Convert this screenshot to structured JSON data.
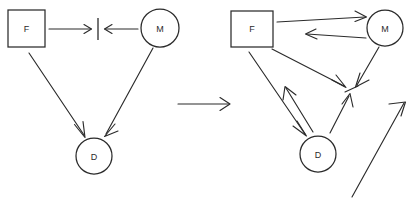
{
  "figure": {
    "background_color": "#ffffff",
    "stroke_color": "#2b2b2b",
    "width": 411,
    "height": 204,
    "style": "hand-drawn line diagram, open v-shaped arrowheads"
  },
  "panels": [
    {
      "id": "left-panel",
      "name": "before-state-diagram",
      "nodes": [
        {
          "id": "F",
          "label": "F",
          "shape": "square",
          "x": 26,
          "y": 28
        },
        {
          "id": "M",
          "label": "M",
          "shape": "circle",
          "x": 160,
          "y": 28
        },
        {
          "id": "D",
          "label": "D",
          "shape": "circle",
          "x": 94,
          "y": 156
        },
        {
          "id": "BAR",
          "label": "",
          "shape": "vertical-bar",
          "x": 98,
          "y": 29
        }
      ],
      "edges": [
        {
          "from": "F",
          "to": "BAR",
          "direction": "forward"
        },
        {
          "from": "M",
          "to": "BAR",
          "direction": "forward"
        },
        {
          "from": "F",
          "to": "D",
          "direction": "forward"
        },
        {
          "from": "M",
          "to": "D",
          "direction": "forward"
        }
      ]
    },
    {
      "id": "transition",
      "name": "transition-arrow",
      "edges": [
        {
          "from": "left-panel",
          "to": "right-panel",
          "direction": "forward"
        }
      ]
    },
    {
      "id": "right-panel",
      "name": "after-state-diagram",
      "nodes": [
        {
          "id": "F2",
          "label": "F",
          "shape": "square",
          "x": 257,
          "y": 28
        },
        {
          "id": "M2",
          "label": "M",
          "shape": "circle",
          "x": 385,
          "y": 28
        },
        {
          "id": "D2",
          "label": "D",
          "shape": "circle",
          "x": 318,
          "y": 154
        },
        {
          "id": "HUB",
          "label": "",
          "shape": "hub-point",
          "x": 350,
          "y": 88
        }
      ],
      "edges": [
        {
          "from": "F2",
          "to": "M2",
          "direction": "forward"
        },
        {
          "from": "M2",
          "to": "F2",
          "direction": "forward"
        },
        {
          "from": "F2",
          "to": "HUB",
          "direction": "forward"
        },
        {
          "from": "M2",
          "to": "HUB",
          "direction": "forward"
        },
        {
          "from": "F2",
          "to": "D2",
          "direction": "forward"
        },
        {
          "from": "D2",
          "to": "F2",
          "direction": "forward"
        },
        {
          "from": "D2",
          "to": "HUB",
          "direction": "forward"
        },
        {
          "from": "lower-left",
          "to": "HUB",
          "direction": "forward"
        }
      ]
    }
  ]
}
